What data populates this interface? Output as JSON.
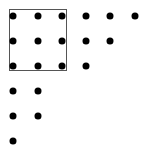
{
  "diagram": {
    "colors": {
      "dot": "#000000",
      "box": "#555555",
      "background": "#ffffff"
    },
    "box": {
      "left": 9,
      "top": 9,
      "width": 58,
      "height": 62
    },
    "dots_inside_box": [
      {
        "x": 13,
        "y": 16
      },
      {
        "x": 38,
        "y": 16
      },
      {
        "x": 62,
        "y": 16
      },
      {
        "x": 13,
        "y": 41
      },
      {
        "x": 38,
        "y": 41
      },
      {
        "x": 62,
        "y": 41
      },
      {
        "x": 13,
        "y": 66
      },
      {
        "x": 38,
        "y": 66
      },
      {
        "x": 62,
        "y": 66
      }
    ],
    "dots_right": [
      {
        "x": 86,
        "y": 16
      },
      {
        "x": 110,
        "y": 16
      },
      {
        "x": 135,
        "y": 16
      },
      {
        "x": 86,
        "y": 41
      },
      {
        "x": 110,
        "y": 41
      },
      {
        "x": 86,
        "y": 66
      }
    ],
    "dots_below": [
      {
        "x": 13,
        "y": 91
      },
      {
        "x": 38,
        "y": 91
      },
      {
        "x": 13,
        "y": 116
      },
      {
        "x": 38,
        "y": 116
      },
      {
        "x": 13,
        "y": 141
      }
    ]
  }
}
